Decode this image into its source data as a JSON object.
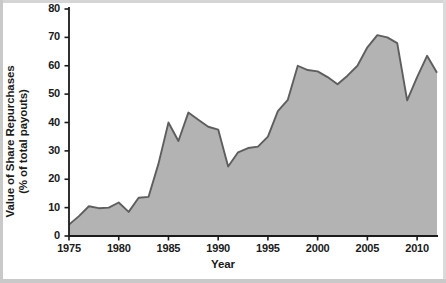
{
  "chart_data": {
    "type": "area",
    "title": "",
    "xlabel": "Year",
    "ylabel": "Value of Share Repurchases (% of total payouts)",
    "ylabel_line1": "Value of Share Repurchases",
    "ylabel_line2": "(% of total payouts)",
    "xlim": [
      1975,
      2012
    ],
    "ylim": [
      0,
      80
    ],
    "grid": false,
    "legend": "none",
    "area_fill_color": "#b3b3b3",
    "line_color": "#5e5e5e",
    "background_color": "#ffffff",
    "axis_color": "#1a1a1a",
    "yticks": [
      0,
      10,
      20,
      30,
      40,
      50,
      60,
      70,
      80
    ],
    "ytick_labels": [
      "0",
      "10",
      "20",
      "30",
      "40",
      "50",
      "60",
      "70",
      "80"
    ],
    "xticks": [
      1975,
      1980,
      1985,
      1990,
      1995,
      2000,
      2005,
      2010
    ],
    "xtick_labels": [
      "1975",
      "1980",
      "1985",
      "1990",
      "1995",
      "2000",
      "2005",
      "2010"
    ],
    "x": [
      1975,
      1976,
      1977,
      1978,
      1979,
      1980,
      1981,
      1982,
      1983,
      1984,
      1985,
      1986,
      1987,
      1988,
      1989,
      1990,
      1991,
      1992,
      1993,
      1994,
      1995,
      1996,
      1997,
      1998,
      1999,
      2000,
      2001,
      2002,
      2003,
      2004,
      2005,
      2006,
      2007,
      2008,
      2009,
      2010,
      2011,
      2012
    ],
    "values": [
      4.0,
      7.0,
      10.5,
      9.8,
      10.0,
      11.8,
      8.5,
      13.5,
      13.8,
      25.5,
      40.0,
      33.5,
      43.5,
      41.0,
      38.5,
      37.5,
      24.5,
      29.5,
      31.0,
      31.5,
      35.0,
      44.0,
      48.0,
      60.0,
      58.5,
      58.0,
      56.0,
      53.5,
      56.5,
      60.0,
      66.5,
      70.8,
      70.0,
      68.0,
      47.8,
      56.0,
      63.5,
      57.5
    ],
    "series_name": "Value of Share Repurchases (% of total payouts)"
  },
  "axes": {
    "xlabel": "Year",
    "ylabel_line1": "Value of Share Repurchases",
    "ylabel_line2": "(% of total payouts)"
  }
}
